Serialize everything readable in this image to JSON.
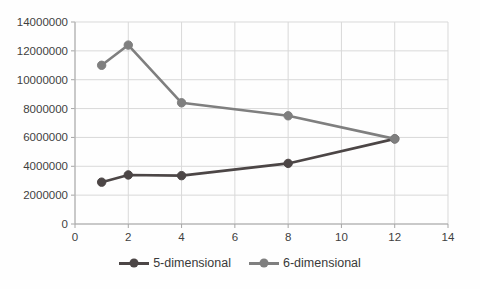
{
  "chart_data": {
    "type": "line",
    "x": [
      1,
      2,
      4,
      8,
      12
    ],
    "series": [
      {
        "name": "5-dimensional",
        "values": [
          2900000,
          3400000,
          3350000,
          4200000,
          5900000
        ],
        "color": "#4c4646"
      },
      {
        "name": "6-dimensional",
        "values": [
          11000000,
          12400000,
          8400000,
          7500000,
          5900000
        ],
        "color": "#7f7f7f"
      }
    ],
    "title": "",
    "xlabel": "",
    "ylabel": "",
    "xlim": [
      0,
      14
    ],
    "ylim": [
      0,
      14000000
    ],
    "x_ticks": [
      0,
      2,
      4,
      6,
      8,
      10,
      12,
      14
    ],
    "y_ticks": [
      0,
      2000000,
      4000000,
      6000000,
      8000000,
      10000000,
      12000000,
      14000000
    ],
    "grid": true,
    "legend_position": "bottom",
    "marker": "circle"
  },
  "style": {
    "gridline_color": "#d9d9d9",
    "axis_line_color": "#a6a6a6",
    "tick_label_color": "#3f3f3f",
    "background": "#ffffff"
  },
  "legend": {
    "items": [
      {
        "label": "5-dimensional",
        "color": "#4c4646"
      },
      {
        "label": "6-dimensional",
        "color": "#7f7f7f"
      }
    ]
  }
}
